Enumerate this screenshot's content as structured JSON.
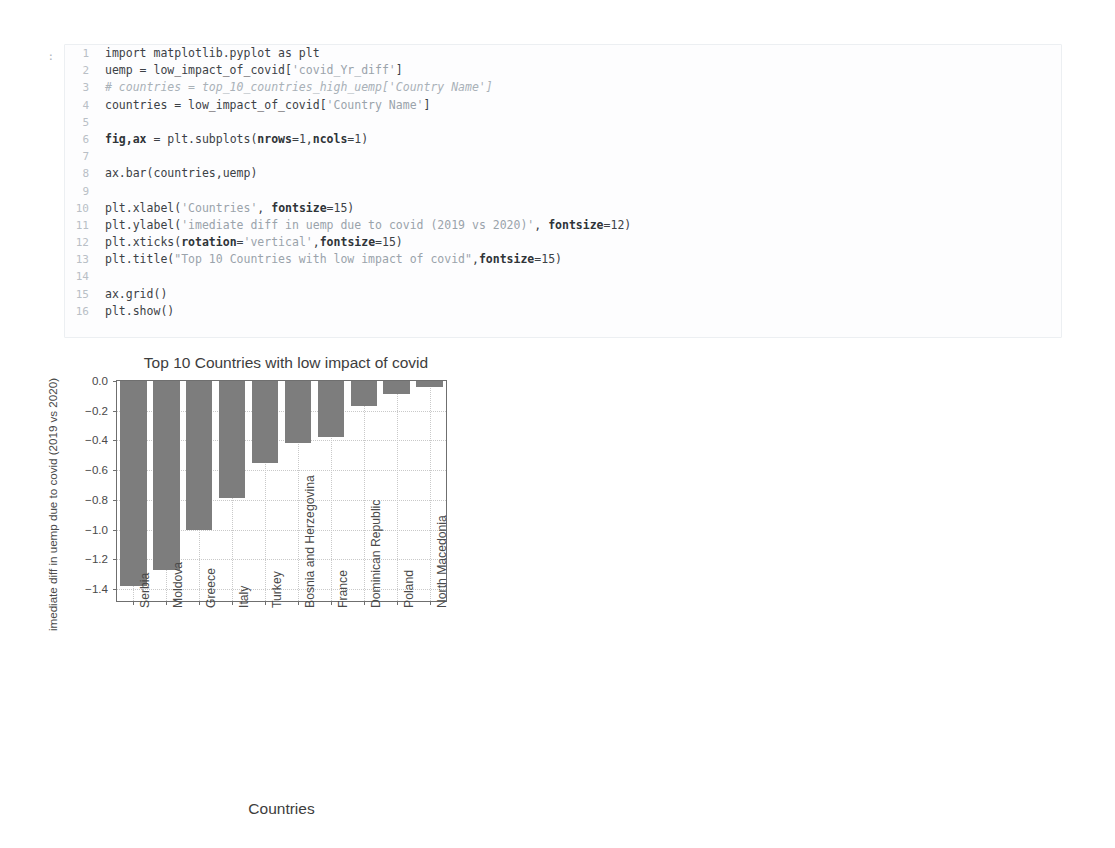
{
  "notebook": {
    "prompt": ":",
    "lines": [
      {
        "n": "1",
        "segments": [
          {
            "t": "import matplotlib.pyplot as plt",
            "c": ""
          }
        ]
      },
      {
        "n": "2",
        "segments": [
          {
            "t": "uemp = low_impact_of_covid[",
            "c": ""
          },
          {
            "t": "'covid_Yr_diff'",
            "c": "tok-str"
          },
          {
            "t": "]",
            "c": ""
          }
        ]
      },
      {
        "n": "3",
        "segments": [
          {
            "t": "# countries = top_10_countries_high_uemp['Country Name']",
            "c": "tok-com"
          }
        ]
      },
      {
        "n": "4",
        "segments": [
          {
            "t": "countries = low_impact_of_covid[",
            "c": ""
          },
          {
            "t": "'Country Name'",
            "c": "tok-str"
          },
          {
            "t": "]",
            "c": ""
          }
        ]
      },
      {
        "n": "5",
        "segments": [
          {
            "t": "",
            "c": ""
          }
        ]
      },
      {
        "n": "6",
        "segments": [
          {
            "t": "fig,ax",
            "c": "tok-b"
          },
          {
            "t": " = plt.subplots(",
            "c": ""
          },
          {
            "t": "nrows",
            "c": "tok-b"
          },
          {
            "t": "=1,",
            "c": ""
          },
          {
            "t": "ncols",
            "c": "tok-b"
          },
          {
            "t": "=1)",
            "c": ""
          }
        ]
      },
      {
        "n": "7",
        "segments": [
          {
            "t": "",
            "c": ""
          }
        ]
      },
      {
        "n": "8",
        "segments": [
          {
            "t": "ax.bar(countries,uemp)",
            "c": ""
          }
        ]
      },
      {
        "n": "9",
        "segments": [
          {
            "t": "",
            "c": ""
          }
        ]
      },
      {
        "n": "10",
        "segments": [
          {
            "t": "plt.xlabel(",
            "c": ""
          },
          {
            "t": "'Countries'",
            "c": "tok-str"
          },
          {
            "t": ", ",
            "c": ""
          },
          {
            "t": "fontsize",
            "c": "tok-b"
          },
          {
            "t": "=15)",
            "c": ""
          }
        ]
      },
      {
        "n": "11",
        "segments": [
          {
            "t": "plt.ylabel(",
            "c": ""
          },
          {
            "t": "'imediate diff in uemp due to covid (2019 vs 2020)'",
            "c": "tok-str"
          },
          {
            "t": ", ",
            "c": ""
          },
          {
            "t": "fontsize",
            "c": "tok-b"
          },
          {
            "t": "=12)",
            "c": ""
          }
        ]
      },
      {
        "n": "12",
        "segments": [
          {
            "t": "plt.xticks(",
            "c": ""
          },
          {
            "t": "rotation",
            "c": "tok-b"
          },
          {
            "t": "=",
            "c": ""
          },
          {
            "t": "'vertical'",
            "c": "tok-str"
          },
          {
            "t": ",",
            "c": ""
          },
          {
            "t": "fontsize",
            "c": "tok-b"
          },
          {
            "t": "=15)",
            "c": ""
          }
        ]
      },
      {
        "n": "13",
        "segments": [
          {
            "t": "plt.title(",
            "c": ""
          },
          {
            "t": "\"Top 10 Countries with low impact of covid\"",
            "c": "tok-str"
          },
          {
            "t": ",",
            "c": ""
          },
          {
            "t": "fontsize",
            "c": "tok-b"
          },
          {
            "t": "=15)",
            "c": ""
          }
        ]
      },
      {
        "n": "14",
        "segments": [
          {
            "t": "",
            "c": ""
          }
        ]
      },
      {
        "n": "15",
        "segments": [
          {
            "t": "ax.grid()",
            "c": ""
          }
        ]
      },
      {
        "n": "16",
        "segments": [
          {
            "t": "plt.show()",
            "c": ""
          }
        ]
      }
    ]
  },
  "chart_data": {
    "type": "bar",
    "title": "Top 10 Countries with low impact of covid",
    "xlabel": "Countries",
    "ylabel": "imediate diff in uemp due to covid (2019 vs 2020)",
    "categories": [
      "Serbia",
      "Moldova",
      "Greece",
      "Italy",
      "Turkey",
      "Bosnia and Herzegovina",
      "France",
      "Dominican Republic",
      "Poland",
      "North Macedonia"
    ],
    "values": [
      -1.38,
      -1.27,
      -1.0,
      -0.79,
      -0.55,
      -0.42,
      -0.38,
      -0.17,
      -0.09,
      -0.04
    ],
    "ylim": [
      -1.48,
      0.0
    ],
    "yticks": [
      0.0,
      -0.2,
      -0.4,
      -0.6,
      -0.8,
      -1.0,
      -1.2,
      -1.4
    ],
    "ytick_labels": [
      "0.0",
      "−0.2",
      "−0.4",
      "−0.6",
      "−0.8",
      "−1.0",
      "−1.2",
      "−1.4"
    ],
    "grid": true,
    "legend": null,
    "bar_color": "#7d7d7d"
  }
}
